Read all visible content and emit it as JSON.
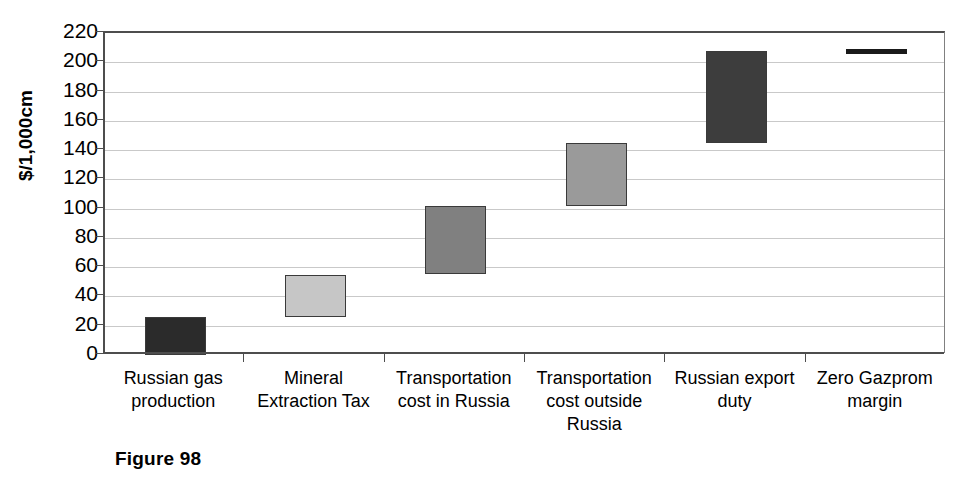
{
  "figure": {
    "caption": "Figure 98"
  },
  "chart_data": {
    "type": "bar",
    "subtype": "waterfall",
    "title": "",
    "xlabel": "",
    "ylabel": "$/1,000cm",
    "ylim": [
      0,
      220
    ],
    "ytick_step": 20,
    "grid": true,
    "legend": false,
    "categories": [
      "Russian gas\nproduction",
      "Mineral\nExtraction Tax",
      "Transportation\ncost in Russia",
      "Transportation\ncost outside\nRussia",
      "Russian export\nduty",
      "Zero Gazprom\nmargin"
    ],
    "ytick_labels": [
      "220",
      "200",
      "180",
      "160",
      "140",
      "120",
      "100",
      "80",
      "60",
      "40",
      "20",
      "0"
    ],
    "ytick_values": [
      220,
      200,
      180,
      160,
      140,
      120,
      100,
      80,
      60,
      40,
      20,
      0
    ],
    "bars": [
      {
        "label": "Russian gas production",
        "base": 0,
        "top": 26,
        "delta": 26,
        "color": "#2b2b2b",
        "style": "bar"
      },
      {
        "label": "Mineral Extraction Tax",
        "base": 26,
        "top": 55,
        "delta": 29,
        "color": "#c6c6c6",
        "style": "bar"
      },
      {
        "label": "Transportation cost in Russia",
        "base": 55,
        "top": 102,
        "delta": 47,
        "color": "#808080",
        "style": "bar"
      },
      {
        "label": "Transportation cost outside Russia",
        "base": 102,
        "top": 145,
        "delta": 43,
        "color": "#9a9a9a",
        "style": "bar"
      },
      {
        "label": "Russian export duty",
        "base": 145,
        "top": 208,
        "delta": 63,
        "color": "#3d3d3d",
        "style": "bar"
      },
      {
        "label": "Zero Gazprom margin",
        "base": 208,
        "top": 208,
        "delta": 0,
        "color": "#1a1a1a",
        "style": "line"
      }
    ],
    "values_cumulative": [
      26,
      55,
      102,
      145,
      208,
      208
    ]
  },
  "colors": {
    "axis": "#4d4d4d",
    "grid": "#c9c9c9",
    "text": "#000000",
    "background": "#ffffff"
  }
}
